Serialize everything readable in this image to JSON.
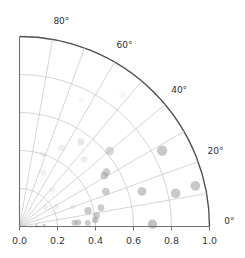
{
  "chart_data": {
    "type": "scatter",
    "projection": "polar-quadrant",
    "title": "",
    "xlabel": "",
    "ylabel": "",
    "rlim": [
      0.0,
      1.0
    ],
    "theta_lim_deg": [
      0,
      90
    ],
    "grid": true,
    "legend": false,
    "radial_ticks": [
      "0.0",
      "0.2",
      "0.4",
      "0.6",
      "0.8",
      "1.0"
    ],
    "radial_tick_values": [
      0.0,
      0.2,
      0.4,
      0.6,
      0.8,
      1.0
    ],
    "radial_gridline_values": [
      0.2,
      0.4,
      0.6,
      0.8,
      1.0
    ],
    "angular_ticks": [
      "0°",
      "20°",
      "40°",
      "60°",
      "80°"
    ],
    "angular_tick_values": [
      0,
      20,
      40,
      60,
      80
    ],
    "angular_gridline_values": [
      10,
      20,
      30,
      40,
      50,
      60,
      70,
      80
    ],
    "marker_color": "#9a9a9a",
    "grid_color": "#c9c9cf",
    "axis_color": "#4e4e52",
    "points": [
      {
        "r": 0.09,
        "theta": 2,
        "size": 1.6,
        "alpha": 0.55
      },
      {
        "r": 0.13,
        "theta": 2,
        "size": 1.8,
        "alpha": 0.5
      },
      {
        "r": 0.29,
        "theta": 4,
        "size": 3.0,
        "alpha": 0.55
      },
      {
        "r": 0.31,
        "theta": 4,
        "size": 3.0,
        "alpha": 0.55
      },
      {
        "r": 0.36,
        "theta": 3,
        "size": 3.0,
        "alpha": 0.5
      },
      {
        "r": 0.4,
        "theta": 5,
        "size": 3.2,
        "alpha": 0.55
      },
      {
        "r": 0.41,
        "theta": 8,
        "size": 3.4,
        "alpha": 0.5
      },
      {
        "r": 0.7,
        "theta": 1,
        "size": 4.6,
        "alpha": 0.6
      },
      {
        "r": 0.37,
        "theta": 13,
        "size": 3.6,
        "alpha": 0.55
      },
      {
        "r": 0.44,
        "theta": 13,
        "size": 3.4,
        "alpha": 0.5
      },
      {
        "r": 0.49,
        "theta": 22,
        "size": 3.8,
        "alpha": 0.5
      },
      {
        "r": 0.67,
        "theta": 16,
        "size": 4.4,
        "alpha": 0.55
      },
      {
        "r": 0.84,
        "theta": 12,
        "size": 4.8,
        "alpha": 0.55
      },
      {
        "r": 0.95,
        "theta": 13,
        "size": 4.8,
        "alpha": 0.55
      },
      {
        "r": 0.52,
        "theta": 31,
        "size": 3.8,
        "alpha": 0.5
      },
      {
        "r": 0.54,
        "theta": 32,
        "size": 3.8,
        "alpha": 0.5
      },
      {
        "r": 0.85,
        "theta": 28,
        "size": 5.2,
        "alpha": 0.55
      },
      {
        "r": 0.62,
        "theta": 40,
        "size": 4.4,
        "alpha": 0.4
      },
      {
        "r": 0.55,
        "theta": 54,
        "size": 3.4,
        "alpha": 0.25
      },
      {
        "r": 0.49,
        "theta": 46,
        "size": 3.2,
        "alpha": 0.18
      },
      {
        "r": 0.47,
        "theta": 62,
        "size": 3.2,
        "alpha": 0.16
      },
      {
        "r": 0.4,
        "theta": 72,
        "size": 3.0,
        "alpha": 0.14
      },
      {
        "r": 0.31,
        "theta": 66,
        "size": 3.0,
        "alpha": 0.14
      },
      {
        "r": 0.26,
        "theta": 48,
        "size": 2.8,
        "alpha": 0.13
      },
      {
        "r": 0.22,
        "theta": 28,
        "size": 2.8,
        "alpha": 0.16
      },
      {
        "r": 0.17,
        "theta": 36,
        "size": 2.6,
        "alpha": 0.13
      },
      {
        "r": 0.3,
        "theta": 20,
        "size": 2.8,
        "alpha": 0.14
      },
      {
        "r": 0.88,
        "theta": 52,
        "size": 3.4,
        "alpha": 0.09
      },
      {
        "r": 0.74,
        "theta": 64,
        "size": 3.0,
        "alpha": 0.08
      }
    ]
  }
}
